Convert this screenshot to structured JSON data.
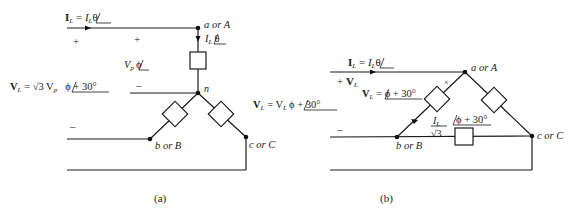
{
  "figure": {
    "panel_a": {
      "caption": "(a)",
      "line_current_label": {
        "bold": "I",
        "sub": "L",
        "eq": " = ",
        "mag": "I",
        "magsub": "L",
        "angle": "θ"
      },
      "phase_current_label": {
        "mag": "I",
        "magsub": "L",
        "angle": "θ"
      },
      "phase_voltage_label": {
        "mag": "V",
        "magsub": "p",
        "angle": "ϕ"
      },
      "line_voltage_left": {
        "bold": "V",
        "sub": "L",
        "eq": " = √3 V",
        "eqsub": "p",
        "angle": "ϕ + 30°"
      },
      "line_voltage_right": {
        "bold": "V",
        "sub": "L",
        "eq": " = V",
        "eqsub": "L",
        "angle": "ϕ + 30°"
      },
      "plus_signs": [
        "+",
        "+"
      ],
      "minus_signs": [
        "–",
        "–"
      ],
      "nodes": {
        "a": "a or A",
        "n": "n",
        "b": "b or B",
        "c": "c or C"
      }
    },
    "panel_b": {
      "caption": "(b)",
      "line_current_label": {
        "bold": "I",
        "sub": "L",
        "eq": " = ",
        "mag": "I",
        "magsub": "L",
        "angle": "θ"
      },
      "line_voltage_symbol": {
        "bold": "V",
        "sub": "L"
      },
      "line_voltage_label": {
        "bold": "V",
        "sub": "L",
        "eq": " = ",
        "angle": "ϕ + 30°"
      },
      "phase_current_label": {
        "num": "I",
        "numsub": "L",
        "den": "√3",
        "angle": "ϕ + 30°"
      },
      "plus_signs": [
        "+"
      ],
      "minus_signs": [
        "–"
      ],
      "markers": [
        "×"
      ],
      "nodes": {
        "a": "a or A",
        "b": "b or B",
        "c": "c or C"
      }
    }
  }
}
